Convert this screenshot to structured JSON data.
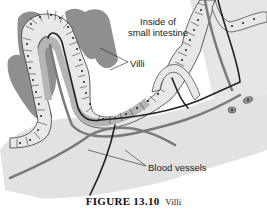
{
  "diagram": {
    "labels": {
      "inside": "Inside of\nsmall intestine",
      "inside_line1": "Inside of",
      "inside_line2": "small intestine",
      "villi": "Villi",
      "blood_vessels": "Blood vessels"
    },
    "caption": {
      "number": "FIGURE 13.10",
      "title": "Villi"
    },
    "colors": {
      "background": "#ffffff",
      "tissue_light": "#e4e4e4",
      "villus_dark": "#8f8f8f",
      "cell_fill": "#e8e8e8",
      "cell_outline": "#3a3a3a",
      "vessel_dark": "#222222",
      "vessel_mid": "#7a7a7a",
      "text": "#1a1a1a"
    }
  }
}
